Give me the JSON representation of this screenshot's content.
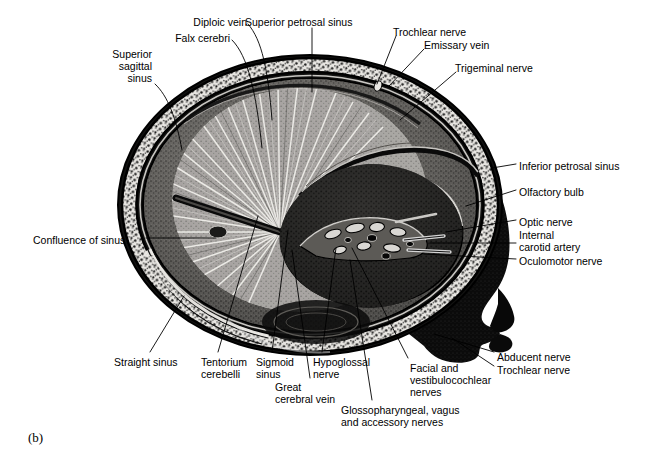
{
  "figure": {
    "caption": "(b)",
    "ink_color": "#000000",
    "background_color": "#ffffff"
  },
  "labels": [
    {
      "id": "diploic-vein",
      "text": "Diploic vein",
      "align": "right",
      "x": 247,
      "y": 16,
      "lines": [
        "Diploic vein"
      ]
    },
    {
      "id": "superior-petrosal",
      "text": "Superior petrosal sinus",
      "align": "left",
      "x": 245,
      "y": 16,
      "lines": [
        "Superior petrosal sinus"
      ]
    },
    {
      "id": "falx-cerebri",
      "text": "Falx cerebri",
      "align": "right",
      "x": 230,
      "y": 32,
      "lines": [
        "Falx cerebri"
      ]
    },
    {
      "id": "trochlear-nerve-top",
      "text": "Trochlear nerve",
      "align": "left",
      "x": 393,
      "y": 26,
      "lines": [
        "Trochlear nerve"
      ]
    },
    {
      "id": "emissary-vein",
      "text": "Emissary vein",
      "align": "left",
      "x": 424,
      "y": 39,
      "lines": [
        "Emissary vein"
      ]
    },
    {
      "id": "trigeminal-nerve",
      "text": "Trigeminal nerve",
      "align": "left",
      "x": 455,
      "y": 62,
      "lines": [
        "Trigeminal nerve"
      ]
    },
    {
      "id": "superior-sagittal",
      "text": "Superior sagittal sinus",
      "align": "right",
      "x": 152,
      "y": 48,
      "lines": [
        "Superior",
        "sagittal",
        "sinus"
      ]
    },
    {
      "id": "inferior-petrosal",
      "text": "Inferior petrosal sinus",
      "align": "left",
      "x": 519,
      "y": 160,
      "lines": [
        "Inferior petrosal sinus"
      ]
    },
    {
      "id": "olfactory-bulb",
      "text": "Olfactory bulb",
      "align": "left",
      "x": 519,
      "y": 186,
      "lines": [
        "Olfactory bulb"
      ]
    },
    {
      "id": "optic-nerve",
      "text": "Optic nerve",
      "align": "left",
      "x": 519,
      "y": 216,
      "lines": [
        "Optic nerve"
      ]
    },
    {
      "id": "internal-carotid",
      "text": "Internal carotid artery",
      "align": "left",
      "x": 519,
      "y": 229,
      "lines": [
        "Internal",
        "carotid artery"
      ]
    },
    {
      "id": "oculomotor-nerve",
      "text": "Oculomotor nerve",
      "align": "left",
      "x": 519,
      "y": 255,
      "lines": [
        "Oculomotor nerve"
      ]
    },
    {
      "id": "confluence-of-sinus",
      "text": "Confluence of sinus",
      "align": "left",
      "x": 33,
      "y": 234,
      "lines": [
        "Confluence of sinus"
      ]
    },
    {
      "id": "straight-sinus",
      "text": "Straight sinus",
      "align": "left",
      "x": 114,
      "y": 356,
      "lines": [
        "Straight sinus"
      ]
    },
    {
      "id": "tentorium-cerebelli",
      "text": "Tentorium cerebelli",
      "align": "left",
      "x": 201,
      "y": 356,
      "lines": [
        "Tentorium",
        "cerebelli"
      ]
    },
    {
      "id": "sigmoid-sinus",
      "text": "Sigmoid sinus",
      "align": "left",
      "x": 256,
      "y": 356,
      "lines": [
        "Sigmoid",
        "sinus"
      ]
    },
    {
      "id": "great-cerebral-vein",
      "text": "Great cerebral vein",
      "align": "left",
      "x": 275,
      "y": 381,
      "lines": [
        "Great",
        "cerebral vein"
      ]
    },
    {
      "id": "hypoglossal-nerve",
      "text": "Hypoglossal nerve",
      "align": "left",
      "x": 313,
      "y": 356,
      "lines": [
        "Hypoglossal",
        "nerve"
      ]
    },
    {
      "id": "facial-vestibulo",
      "text": "Facial and vestibulocochlear nerves",
      "align": "left",
      "x": 410,
      "y": 362,
      "lines": [
        "Facial and",
        "vestibulocochlear",
        "nerves"
      ]
    },
    {
      "id": "glossopharyngeal",
      "text": "Glossopharyngeal, vagus and accessory nerves",
      "align": "left",
      "x": 341,
      "y": 404,
      "lines": [
        "Glossopharyngeal, vagus",
        "and accessory nerves"
      ]
    },
    {
      "id": "abducent-nerve",
      "text": "Abducent nerve",
      "align": "left",
      "x": 497,
      "y": 351,
      "lines": [
        "Abducent nerve"
      ]
    },
    {
      "id": "trochlear-nerve-bot",
      "text": "Trochlear nerve",
      "align": "left",
      "x": 497,
      "y": 364,
      "lines": [
        "Trochlear nerve"
      ]
    }
  ],
  "leaders": [
    {
      "id": "leader-diploic-vein",
      "path": "M 248,24 C 262,40 268,70 272,120"
    },
    {
      "id": "leader-superior-petrosal",
      "path": "M 312,28 L 312,92"
    },
    {
      "id": "leader-falx-cerebri",
      "path": "M 232,40 C 248,56 256,92 262,148"
    },
    {
      "id": "leader-trochlear-top",
      "path": "M 396,36 L 377,84"
    },
    {
      "id": "leader-emissary-vein",
      "path": "M 424,49 L 389,86"
    },
    {
      "id": "leader-trigeminal",
      "path": "M 456,72 L 400,120"
    },
    {
      "id": "leader-superior-sagittal",
      "path": "M 155,84 C 168,96 176,118 182,150"
    },
    {
      "id": "leader-inferior-petrosal",
      "path": "M 516,164 L 492,168"
    },
    {
      "id": "leader-olfactory-bulb",
      "path": "M 516,190 L 466,206"
    },
    {
      "id": "leader-optic-nerve",
      "path": "M 516,220 L 446,232"
    },
    {
      "id": "leader-internal-carotid",
      "path": "M 516,243 L 430,243"
    },
    {
      "id": "leader-oculomotor",
      "path": "M 516,259 L 424,254"
    },
    {
      "id": "leader-confluence",
      "path": "M 146,238 L 216,238"
    },
    {
      "id": "leader-straight-sinus",
      "path": "M 150,352 L 184,296"
    },
    {
      "id": "leader-tentorium",
      "path": "M 218,352 L 258,216"
    },
    {
      "id": "leader-sigmoid",
      "path": "M 272,352 L 288,230"
    },
    {
      "id": "leader-great-cerebral-vein",
      "path": "M 310,378 L 292,250"
    },
    {
      "id": "leader-hypoglossal",
      "path": "M 322,352 L 336,248"
    },
    {
      "id": "leader-facial-vestibulo",
      "path": "M 408,358 L 352,248"
    },
    {
      "id": "leader-glossopharyngeal",
      "path": "M 372,400 L 350,260"
    },
    {
      "id": "leader-abducent",
      "path": "M 494,352 L 434,334"
    },
    {
      "id": "leader-trochlear-bot",
      "path": "M 494,366 L 452,338"
    }
  ]
}
